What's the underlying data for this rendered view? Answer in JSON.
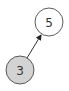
{
  "diagram": {
    "type": "tree",
    "nodes": [
      {
        "id": "n5",
        "label": "5",
        "cx": 49,
        "cy": 22,
        "r": 14,
        "fill": "#ffffff",
        "stroke": "#333333"
      },
      {
        "id": "n3",
        "label": "3",
        "cx": 20,
        "cy": 70,
        "r": 14,
        "fill": "#d3d3d3",
        "stroke": "#333333"
      }
    ],
    "edges": [
      {
        "from": "n3",
        "to": "n5",
        "directed": true
      }
    ]
  }
}
